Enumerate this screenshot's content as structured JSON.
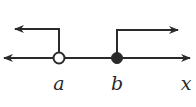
{
  "diagram": {
    "type": "number-line",
    "axis_label": "x",
    "points": [
      {
        "label": "a",
        "marker": "open-circle",
        "ray_direction": "left"
      },
      {
        "label": "b",
        "marker": "closed-dot",
        "ray_direction": "right"
      }
    ],
    "colors": {
      "stroke": "#2a2a2a",
      "background": "#ffffff"
    }
  }
}
